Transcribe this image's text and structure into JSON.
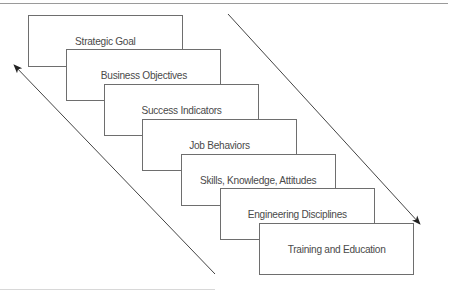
{
  "diagram": {
    "type": "cascade",
    "boxes": [
      {
        "label": "Strategic Goal"
      },
      {
        "label": "Business Objectives"
      },
      {
        "label": "Success Indicators"
      },
      {
        "label": "Job Behaviors"
      },
      {
        "label": "Skills, Knowledge, Attitudes"
      },
      {
        "label": "Engineering Disciplines"
      },
      {
        "label": "Training and Education"
      }
    ],
    "arrows": [
      {
        "name": "downward-arrow",
        "direction": "down-right"
      },
      {
        "name": "upward-arrow",
        "direction": "up-left"
      }
    ],
    "colors": {
      "box_border": "#6e6e6e",
      "text": "#4a4a4a",
      "arrow": "#333333",
      "rule": "#9a9a9a"
    }
  }
}
